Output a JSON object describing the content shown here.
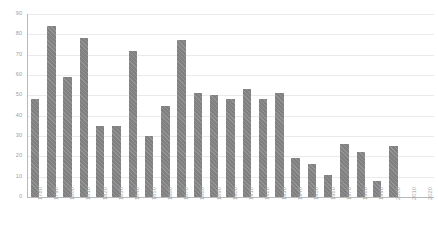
{
  "chart_data": {
    "type": "bar",
    "title": "",
    "subtitle": "",
    "xlabel": "",
    "ylabel": "",
    "ylim": [
      0,
      90
    ],
    "yticks": [
      0,
      10,
      20,
      30,
      40,
      50,
      60,
      70,
      80,
      90
    ],
    "grid": true,
    "legend": null,
    "bar_color": "#808080",
    "grid_color": "#eaeaea",
    "axis_color": "#b9b9b9",
    "tick_label_color": "#a0a0a0",
    "categories": [
      "1780",
      "1790",
      "1800",
      "1810",
      "1820",
      "1830",
      "1840",
      "1850",
      "1860",
      "1870",
      "1880",
      "1890",
      "1900",
      "1910",
      "1920",
      "1930",
      "1940",
      "1950",
      "1960",
      "1970",
      "1980",
      "1990",
      "2000",
      "2010",
      "2020"
    ],
    "values": [
      48,
      84,
      59,
      78,
      35,
      35,
      72,
      30,
      45,
      77,
      51,
      50,
      48,
      53,
      48,
      51,
      19,
      16,
      11,
      26,
      22,
      8,
      25,
      0,
      0
    ]
  }
}
